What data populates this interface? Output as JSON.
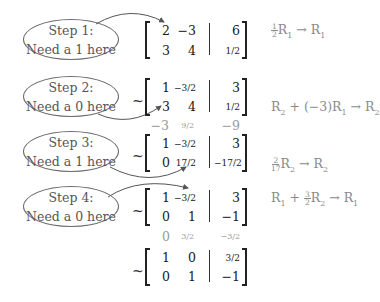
{
  "steps": [
    {
      "title": "Step 1:",
      "text": "Need a 1 here"
    },
    {
      "title": "Step 2:",
      "text": "Need a 0 here"
    },
    {
      "title": "Step 3:",
      "text": "Need a 1 here"
    },
    {
      "title": "Step 4:",
      "text": "Need a 0 here"
    }
  ],
  "tilde": "~",
  "matrices": [
    {
      "rows": [
        [
          "2",
          "−3",
          "6"
        ],
        [
          "3",
          "4",
          "1/2"
        ]
      ]
    },
    {
      "rows": [
        [
          "1",
          "−3/2",
          "3"
        ],
        [
          "3",
          "4",
          "1/2"
        ]
      ]
    },
    {
      "rows": [
        [
          "1",
          "−3/2",
          "3"
        ],
        [
          "0",
          "17/2",
          "−17/2"
        ]
      ]
    },
    {
      "rows": [
        [
          "1",
          "−3/2",
          "3"
        ],
        [
          "0",
          "1",
          "−1"
        ]
      ]
    },
    {
      "rows": [
        [
          "1",
          "0",
          "3/2"
        ],
        [
          "0",
          "1",
          "−1"
        ]
      ]
    }
  ],
  "side_notes": [
    {
      "values": [
        "−3",
        "9/2",
        "−9"
      ]
    },
    {
      "values": [
        "0",
        "3/2",
        "−3/2"
      ]
    }
  ],
  "operations": [
    {
      "text": "½R₁ → R₁",
      "coef": {
        "num": "1",
        "den": "2"
      },
      "lhs": "R",
      "lhs_sub": "1",
      "arrow": "→",
      "rhs": "R",
      "rhs_sub": "1"
    },
    {
      "text": "R₂ + (−3)R₁ → R₂",
      "part1": "R",
      "sub1": "2",
      "mid": " + (−3)R",
      "sub2": "1",
      "arrow": " → R",
      "sub3": "2"
    },
    {
      "text": "(2/17)R₂ → R₂",
      "coef": {
        "num": "2",
        "den": "17"
      },
      "lhs": "R",
      "lhs_sub": "2",
      "arrow": "→",
      "rhs": "R",
      "rhs_sub": "2"
    },
    {
      "text": "R₁ + (3/2)R₂ → R₁",
      "part1": "R",
      "sub1": "1",
      "plus": " + ",
      "coef": {
        "num": "3",
        "den": "2"
      },
      "mid": "R",
      "sub2": "2",
      "arrow": " → R",
      "sub3": "1"
    }
  ]
}
